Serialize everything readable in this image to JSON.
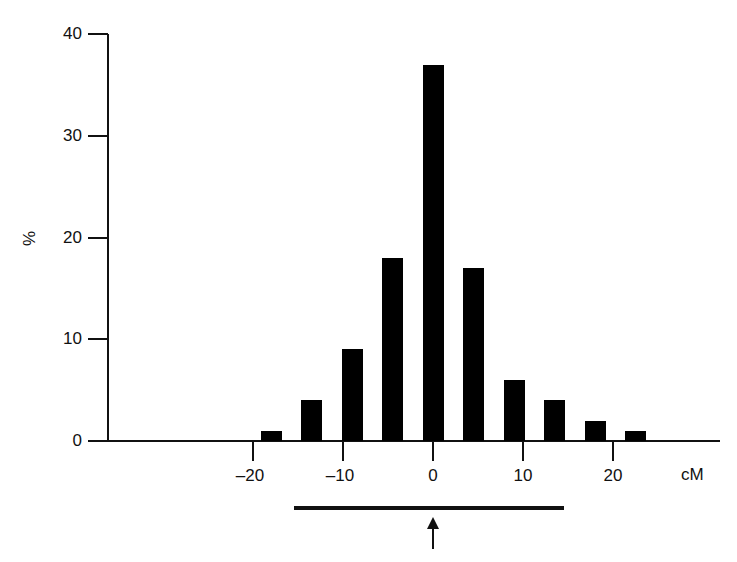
{
  "chart_data": {
    "type": "bar",
    "title": "",
    "xlabel": "cM",
    "ylabel": "%",
    "ylim": [
      0,
      40
    ],
    "xlim": [
      -37,
      35
    ],
    "yticks": [
      0,
      10,
      20,
      30,
      40
    ],
    "xticks": [
      -20,
      -10,
      0,
      10,
      20
    ],
    "ytick_labels": [
      "0",
      "10",
      "20",
      "30",
      "40"
    ],
    "xtick_labels": [
      "–20",
      "–10",
      "0",
      "10",
      "20"
    ],
    "grid": false,
    "legend": null,
    "bin_width_cM": 4.5,
    "categories": [
      -18,
      -13.5,
      -9,
      -4.5,
      0,
      4.5,
      9,
      13.5,
      18,
      22.5
    ],
    "values": [
      1,
      4,
      9,
      18,
      37,
      17,
      6,
      4,
      2,
      1
    ],
    "annotations": [
      {
        "type": "horizontal-bar",
        "from_cM": -15.5,
        "to_cM": 14.5,
        "position": "below x-axis"
      },
      {
        "type": "up-arrow",
        "at_cM": 0,
        "position": "below horizontal bar"
      }
    ]
  },
  "labels": {
    "y_axis_title": "%",
    "x_axis_title": "cM"
  }
}
